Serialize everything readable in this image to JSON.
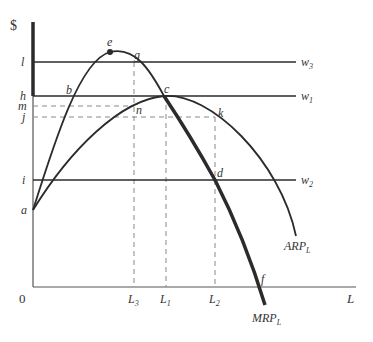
{
  "diagram": {
    "type": "economics-labor-market",
    "y_axis_label": "$",
    "x_axis_label": "L",
    "origin_label": "0",
    "y_ticks": [
      {
        "id": "l",
        "label": "l",
        "y": 62
      },
      {
        "id": "h",
        "label": "h",
        "y": 96
      },
      {
        "id": "m",
        "label": "m",
        "y": 106
      },
      {
        "id": "j",
        "label": "j",
        "y": 117
      },
      {
        "id": "i",
        "label": "i",
        "y": 180
      },
      {
        "id": "a",
        "label": "a",
        "y": 210
      }
    ],
    "x_ticks": [
      {
        "id": "L3",
        "base": "L",
        "sub": "3",
        "x": 134
      },
      {
        "id": "L1",
        "base": "L",
        "sub": "1",
        "x": 166
      },
      {
        "id": "L2",
        "base": "L",
        "sub": "2",
        "x": 215
      }
    ],
    "wage_lines": [
      {
        "id": "w3",
        "base": "w",
        "sub": "3",
        "y": 62
      },
      {
        "id": "w1",
        "base": "w",
        "sub": "1",
        "y": 96
      },
      {
        "id": "w2",
        "base": "w",
        "sub": "2",
        "y": 180
      }
    ],
    "points": [
      {
        "id": "e",
        "label": "e"
      },
      {
        "id": "g",
        "label": "g"
      },
      {
        "id": "b",
        "label": "b"
      },
      {
        "id": "c",
        "label": "c"
      },
      {
        "id": "n",
        "label": "n"
      },
      {
        "id": "k",
        "label": "k"
      },
      {
        "id": "d",
        "label": "d"
      },
      {
        "id": "f",
        "label": "f"
      }
    ],
    "curves": [
      {
        "id": "ARP",
        "base": "ARP",
        "sub": "L"
      },
      {
        "id": "MRP",
        "base": "MRP",
        "sub": "L"
      }
    ],
    "colors": {
      "axis": "#555555",
      "curve": "#2b2b2b",
      "dashed": "#888888",
      "text": "#333333"
    }
  }
}
